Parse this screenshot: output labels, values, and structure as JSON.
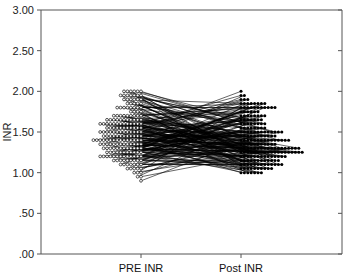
{
  "chart_data": {
    "type": "line",
    "subtype": "paired dot/spaghetti plot",
    "title": "",
    "xlabel": "",
    "ylabel": "INR",
    "ylim": [
      0,
      3
    ],
    "yticks": [
      ".00",
      ".50",
      "1.00",
      "1.50",
      "2.00",
      "2.50",
      "3.00"
    ],
    "ytick_values": [
      0,
      0.5,
      1.0,
      1.5,
      2.0,
      2.5,
      3.0
    ],
    "categories": [
      "PRE INR",
      "Post INR"
    ],
    "grid": false,
    "legend": null,
    "markers": {
      "PRE INR": "open circle",
      "Post INR": "filled circle"
    },
    "series": [
      {
        "name": "PRE INR",
        "distribution": [
          {
            "value": 2.0,
            "count": 6
          },
          {
            "value": 1.95,
            "count": 7
          },
          {
            "value": 1.9,
            "count": 6
          },
          {
            "value": 1.85,
            "count": 5
          },
          {
            "value": 1.8,
            "count": 8
          },
          {
            "value": 1.75,
            "count": 4
          },
          {
            "value": 1.7,
            "count": 9
          },
          {
            "value": 1.65,
            "count": 11
          },
          {
            "value": 1.6,
            "count": 13
          },
          {
            "value": 1.55,
            "count": 11
          },
          {
            "value": 1.5,
            "count": 13
          },
          {
            "value": 1.45,
            "count": 12
          },
          {
            "value": 1.4,
            "count": 15
          },
          {
            "value": 1.35,
            "count": 13
          },
          {
            "value": 1.3,
            "count": 12
          },
          {
            "value": 1.25,
            "count": 11
          },
          {
            "value": 1.2,
            "count": 13
          },
          {
            "value": 1.15,
            "count": 9
          },
          {
            "value": 1.1,
            "count": 7
          },
          {
            "value": 1.05,
            "count": 5
          },
          {
            "value": 1.0,
            "count": 3
          },
          {
            "value": 0.95,
            "count": 2
          },
          {
            "value": 0.9,
            "count": 1
          }
        ]
      },
      {
        "name": "Post INR",
        "distribution": [
          {
            "value": 2.0,
            "count": 1
          },
          {
            "value": 1.95,
            "count": 2
          },
          {
            "value": 1.9,
            "count": 3
          },
          {
            "value": 1.85,
            "count": 8
          },
          {
            "value": 1.8,
            "count": 11
          },
          {
            "value": 1.75,
            "count": 6
          },
          {
            "value": 1.7,
            "count": 8
          },
          {
            "value": 1.65,
            "count": 7
          },
          {
            "value": 1.6,
            "count": 8
          },
          {
            "value": 1.55,
            "count": 8
          },
          {
            "value": 1.5,
            "count": 13
          },
          {
            "value": 1.45,
            "count": 11
          },
          {
            "value": 1.4,
            "count": 15
          },
          {
            "value": 1.35,
            "count": 11
          },
          {
            "value": 1.3,
            "count": 18
          },
          {
            "value": 1.25,
            "count": 19
          },
          {
            "value": 1.2,
            "count": 14
          },
          {
            "value": 1.15,
            "count": 12
          },
          {
            "value": 1.1,
            "count": 13
          },
          {
            "value": 1.05,
            "count": 10
          },
          {
            "value": 1.0,
            "count": 7
          }
        ]
      }
    ]
  },
  "axes": {
    "y_title": "INR",
    "y_tick_labels": [
      ".00",
      ".50",
      "1.00",
      "1.50",
      "2.00",
      "2.50",
      "3.00"
    ],
    "x_tick_labels": [
      "PRE INR",
      "Post INR"
    ]
  },
  "colors": {
    "pre_marker": "#ffffff",
    "marker_stroke": "#111111",
    "post_marker": "#000000",
    "connector": "#000000",
    "axis": "#555555"
  }
}
